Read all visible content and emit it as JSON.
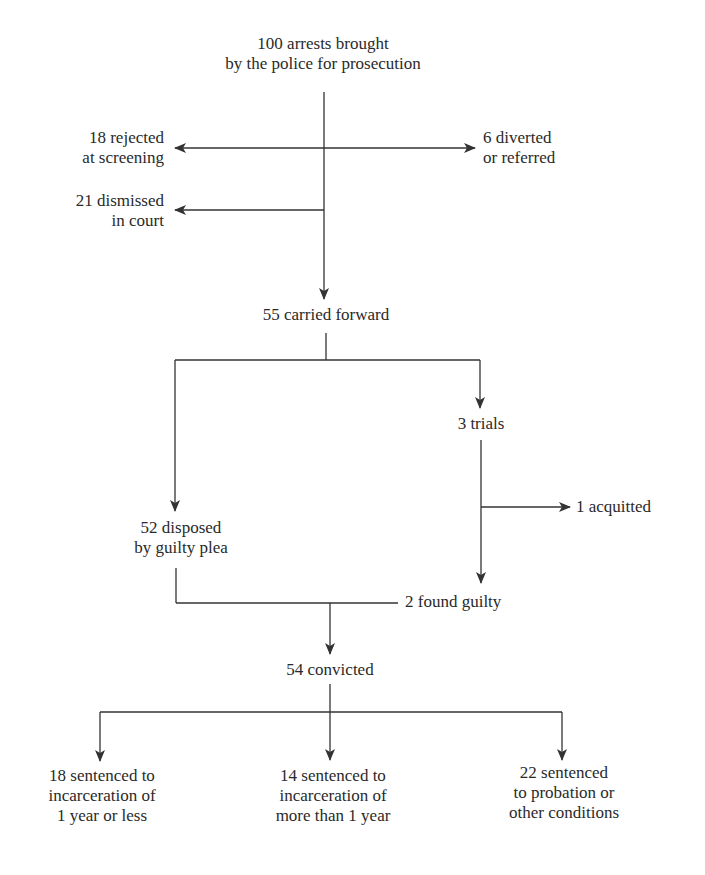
{
  "diagram": {
    "type": "flowchart",
    "arrow_color": "#333333",
    "nodes": {
      "arrests": {
        "count": 100,
        "lines": [
          "100 arrests brought",
          "by the police for prosecution"
        ]
      },
      "rejected": {
        "count": 18,
        "lines": [
          "18 rejected",
          "at screening"
        ]
      },
      "diverted": {
        "count": 6,
        "lines": [
          "6 diverted",
          "or referred"
        ]
      },
      "dismissed": {
        "count": 21,
        "lines": [
          "21 dismissed",
          "in court"
        ]
      },
      "carried_forward": {
        "count": 55,
        "lines": [
          "55 carried forward"
        ]
      },
      "trials": {
        "count": 3,
        "lines": [
          "3 trials"
        ]
      },
      "acquitted": {
        "count": 1,
        "lines": [
          "1 acquitted"
        ]
      },
      "guilty_plea": {
        "count": 52,
        "lines": [
          "52 disposed",
          "by guilty plea"
        ]
      },
      "found_guilty": {
        "count": 2,
        "lines": [
          "2 found guilty"
        ]
      },
      "convicted": {
        "count": 54,
        "lines": [
          "54 convicted"
        ]
      },
      "sentenced_short": {
        "count": 18,
        "lines": [
          "18 sentenced to",
          "incarceration of",
          "1 year or less"
        ]
      },
      "sentenced_long": {
        "count": 14,
        "lines": [
          "14 sentenced to",
          "incarceration of",
          "more than 1 year"
        ]
      },
      "sentenced_probation": {
        "count": 22,
        "lines": [
          "22 sentenced",
          "to probation or",
          "other conditions"
        ]
      }
    },
    "edges": [
      {
        "from": "arrests",
        "to": "rejected"
      },
      {
        "from": "arrests",
        "to": "diverted"
      },
      {
        "from": "arrests",
        "to": "dismissed"
      },
      {
        "from": "arrests",
        "to": "carried_forward"
      },
      {
        "from": "carried_forward",
        "to": "guilty_plea"
      },
      {
        "from": "carried_forward",
        "to": "trials"
      },
      {
        "from": "trials",
        "to": "acquitted"
      },
      {
        "from": "trials",
        "to": "found_guilty"
      },
      {
        "from": "guilty_plea",
        "to": "convicted"
      },
      {
        "from": "found_guilty",
        "to": "convicted"
      },
      {
        "from": "convicted",
        "to": "sentenced_short"
      },
      {
        "from": "convicted",
        "to": "sentenced_long"
      },
      {
        "from": "convicted",
        "to": "sentenced_probation"
      }
    ]
  }
}
